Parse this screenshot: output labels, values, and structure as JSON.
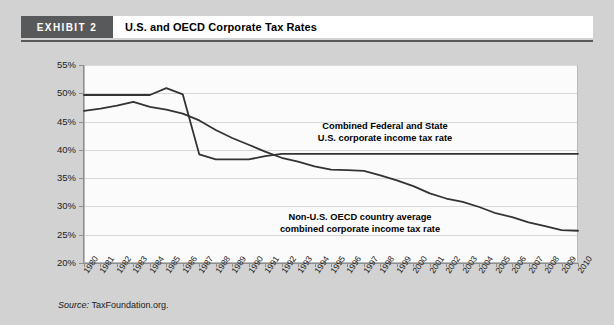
{
  "header": {
    "badge": "EXHIBIT 2",
    "title": "U.S. and OECD Corporate Tax Rates"
  },
  "source": {
    "label": "Source:",
    "text": "TaxFoundation.org."
  },
  "annotations": {
    "us": "Combined Federal and State\nU.S. corporate income tax rate",
    "us_line1": "Combined Federal and State",
    "us_line2": "U.S. corporate income tax rate",
    "oecd_line1": "Non-U.S. OECD country average",
    "oecd_line2": "combined corporate income tax rate"
  },
  "colors": {
    "page_background": "#d2d2d2",
    "badge_background": "#58595b",
    "title_background": "#ffffff",
    "plot_background": "#fbfbfb",
    "grid": "#d8d8d8",
    "axis": "#8e8e8e",
    "series_line": "#333333"
  },
  "chart_data": {
    "type": "line",
    "title": "U.S. and OECD Corporate Tax Rates",
    "xlabel": "",
    "ylabel": "",
    "grid": true,
    "legend": "annotated-inline",
    "xlim": [
      1980,
      2010
    ],
    "ylim": [
      20,
      55
    ],
    "ytick_step": 5,
    "ytick_labels": [
      "55%",
      "50%",
      "45%",
      "40%",
      "35%",
      "30%",
      "25%",
      "20%"
    ],
    "ytick_values": [
      55,
      50,
      45,
      40,
      35,
      30,
      25,
      20
    ],
    "categories": [
      "1980",
      "1981",
      "1982",
      "1983",
      "1984",
      "1985",
      "1986",
      "1987",
      "1988",
      "1989",
      "1990",
      "1991",
      "1992",
      "1993",
      "1994",
      "1995",
      "1996",
      "1997",
      "1998",
      "1999",
      "2000",
      "2001",
      "2002",
      "2003",
      "2004",
      "2005",
      "2006",
      "2007",
      "2008",
      "2009",
      "2010"
    ],
    "series": [
      {
        "name": "Combined Federal and State U.S. corporate income tax rate",
        "values": [
          49.7,
          49.7,
          49.7,
          49.7,
          49.7,
          50.9,
          49.8,
          39.2,
          38.3,
          38.3,
          38.3,
          38.9,
          39.3,
          39.3,
          39.3,
          39.3,
          39.3,
          39.3,
          39.3,
          39.3,
          39.3,
          39.3,
          39.3,
          39.3,
          39.3,
          39.3,
          39.3,
          39.3,
          39.3,
          39.3,
          39.3
        ]
      },
      {
        "name": "Non-U.S. OECD country average combined corporate income tax rate",
        "values": [
          46.9,
          47.3,
          47.8,
          48.5,
          47.6,
          47.1,
          46.4,
          45.2,
          43.5,
          42.1,
          40.9,
          39.7,
          38.6,
          37.9,
          37.1,
          36.5,
          36.4,
          36.3,
          35.5,
          34.6,
          33.6,
          32.3,
          31.4,
          30.8,
          29.9,
          28.8,
          28.1,
          27.2,
          26.5,
          25.8,
          25.7
        ]
      }
    ]
  }
}
